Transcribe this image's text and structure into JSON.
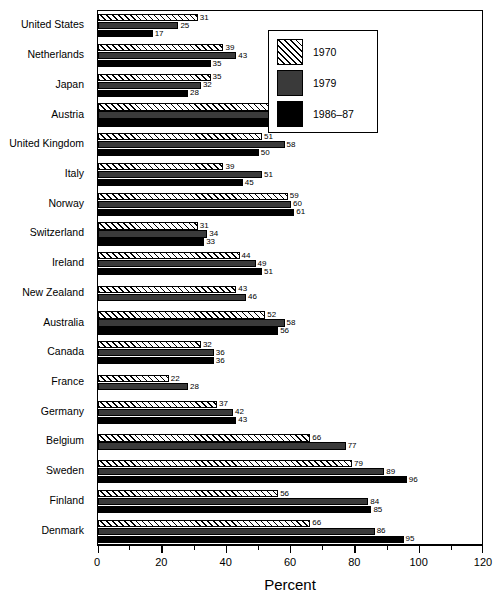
{
  "chart_data": {
    "type": "bar",
    "orientation": "horizontal",
    "title": "",
    "xlabel": "Percent",
    "ylabel": "",
    "xlim": [
      0,
      120
    ],
    "xticks": [
      0,
      20,
      40,
      60,
      80,
      100,
      120
    ],
    "xtick_labels": [
      "0",
      "20",
      "40",
      "60",
      "80",
      "100",
      "120"
    ],
    "minor_tick_step": 10,
    "grid": false,
    "legend_position": "top-right",
    "categories": [
      "United States",
      "Netherlands",
      "Japan",
      "Austria",
      "United Kingdom",
      "Italy",
      "Norway",
      "Switzerland",
      "Ireland",
      "New Zealand",
      "Australia",
      "Canada",
      "France",
      "Germany",
      "Belgium",
      "Sweden",
      "Finland",
      "Denmark"
    ],
    "series": [
      {
        "name": "1970",
        "key": "y1970",
        "color": "#ffffff",
        "pattern": "diagonal-hatch",
        "values": [
          31,
          39,
          35,
          64,
          51,
          39,
          59,
          31,
          44,
          43,
          52,
          32,
          22,
          37,
          66,
          79,
          56,
          66
        ]
      },
      {
        "name": "1979",
        "key": "y1979",
        "color": "#3a3a3a",
        "pattern": "solid",
        "values": [
          25,
          43,
          32,
          59,
          58,
          51,
          60,
          34,
          49,
          46,
          58,
          36,
          28,
          42,
          77,
          89,
          84,
          86
        ]
      },
      {
        "name": "1986–87",
        "key": "y1986",
        "color": "#000000",
        "pattern": "solid",
        "values": [
          17,
          35,
          28,
          61,
          50,
          45,
          61,
          33,
          51,
          null,
          56,
          36,
          null,
          43,
          null,
          96,
          85,
          95
        ]
      }
    ]
  },
  "legend": {
    "entries": [
      {
        "label": "1970",
        "key": "y1970"
      },
      {
        "label": "1979",
        "key": "y1979"
      },
      {
        "label": "1986–87",
        "key": "y1986"
      }
    ]
  }
}
